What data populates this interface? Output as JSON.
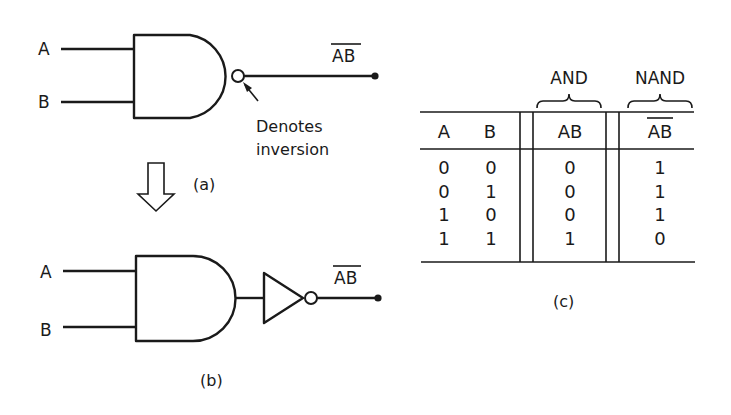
{
  "figure": {
    "part_a": {
      "caption": "(a)",
      "input_a_label": "A",
      "input_b_label": "B",
      "gate": "NAND",
      "output_label": "AB",
      "output_overbar": true,
      "annotation_line1": "Denotes",
      "annotation_line2": "inversion",
      "icons": [
        "nand-gate-icon",
        "inversion-bubble-icon",
        "pointer-arrow-icon",
        "output-terminal-dot"
      ]
    },
    "transform_arrow": {
      "icon": "hollow-down-arrow-icon"
    },
    "part_b": {
      "caption": "(b)",
      "input_a_label": "A",
      "input_b_label": "B",
      "gates": [
        "AND",
        "NOT"
      ],
      "output_label": "AB",
      "output_overbar": true,
      "icons": [
        "and-gate-icon",
        "inverter-triangle-icon",
        "inversion-bubble-icon",
        "output-terminal-dot"
      ]
    },
    "part_c": {
      "caption": "(c)",
      "group_labels": {
        "and": "AND",
        "nand": "NAND"
      },
      "headers": [
        "A",
        "B",
        "AB",
        "AB"
      ],
      "header_overbar": [
        false,
        false,
        false,
        true
      ],
      "rows": [
        [
          "0",
          "0",
          "0",
          "1"
        ],
        [
          "0",
          "1",
          "0",
          "1"
        ],
        [
          "1",
          "0",
          "0",
          "1"
        ],
        [
          "1",
          "1",
          "1",
          "0"
        ]
      ]
    }
  }
}
